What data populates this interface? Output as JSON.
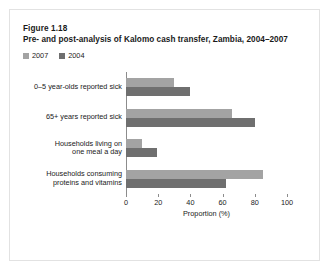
{
  "figure": {
    "number": "Figure 1.18",
    "title": "Pre- and post-analysis of Kalomo cash transfer, Zambia, 2004–2007"
  },
  "colors": {
    "series_2007": "#a3a3a3",
    "series_2004": "#6f6f6f",
    "axis": "#8c8c8c",
    "text": "#1a1a1a",
    "border": "#e2e2e2",
    "background": "#ffffff"
  },
  "chart_data": {
    "type": "bar",
    "orientation": "horizontal",
    "title": "Pre- and post-analysis of Kalomo cash transfer, Zambia, 2004–2007",
    "xlabel": "Proportion (%)",
    "ylabel": "",
    "xlim": [
      0,
      100
    ],
    "xticks": [
      "0",
      "20",
      "40",
      "60",
      "80",
      "100"
    ],
    "grid": false,
    "legend_position": "top-left",
    "categories": [
      "0–5 year-olds reported sick",
      "65+ years reported sick",
      "Households living on\none meal a day",
      "Households consuming\nproteins and vitamins"
    ],
    "series": [
      {
        "name": "2007",
        "color": "#a3a3a3",
        "values": [
          30,
          66,
          10,
          85
        ]
      },
      {
        "name": "2004",
        "color": "#6f6f6f",
        "values": [
          40,
          80,
          19,
          62
        ]
      }
    ]
  }
}
